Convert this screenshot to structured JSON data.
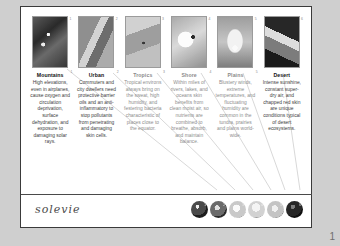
{
  "page": {
    "logo": "solevie",
    "page_number": "1"
  },
  "columns": [
    {
      "index": "1",
      "heading": "Mountains",
      "body": "High elevations, even in airplanes, cause oxygen and circulation deprivation, surface dehydration, and exposure to damaging solar rays.",
      "thumb_name": "mountains-photo",
      "faded": false
    },
    {
      "index": "2",
      "heading": "Urban",
      "body": "Commuters and city dwellers need protective barrier oils and an anti-inflammatory to stop pollutants from penetrating and damaging skin cells.",
      "thumb_name": "urban-photo",
      "faded": false
    },
    {
      "index": "3",
      "heading": "Tropics",
      "body": "Tropical environs always bring on the sweat, high humidity, and festering bacteria characteristic of places close to the equator.",
      "thumb_name": "tropics-photo",
      "faded": true
    },
    {
      "index": "4",
      "heading": "Shore",
      "body": "Within miles of rivers, lakes, and oceans skin benefits from clean moist air, so nutrients are combined to breathe, absorb, and maintain balance.",
      "thumb_name": "shore-photo",
      "faded": true
    },
    {
      "index": "5",
      "heading": "Plains",
      "body": "Blustery winds, extreme temperatures, and fluctuating humidity are common in the tundra, prairies and plains world-wide.",
      "thumb_name": "plains-photo",
      "faded": true
    },
    {
      "index": "6",
      "heading": "Desert",
      "body": "Intense sunshine, constant super-dry air, and chapped red skin are unique conditions typical of desert ecosystems.",
      "thumb_name": "desert-photo",
      "faded": false
    }
  ],
  "product_dots": [
    {
      "label": "1"
    },
    {
      "label": "2"
    },
    {
      "label": "3"
    },
    {
      "label": "4"
    },
    {
      "label": "5"
    },
    {
      "label": "6"
    }
  ],
  "colors": {
    "page_background": "#ffffff",
    "scan_background": "#cfcfcf",
    "border": "#3a3a3a",
    "text": "#3d3d3d",
    "faded_text": "#8e8e8e",
    "logo": "#4a4a4a"
  }
}
